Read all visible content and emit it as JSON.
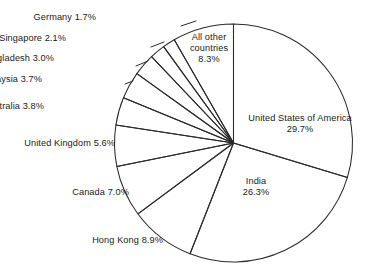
{
  "chart_data": {
    "type": "pie",
    "title": "",
    "subtitle": "",
    "xlabel": "",
    "ylabel": "",
    "legend_position": "none",
    "grid": false,
    "units": "percent",
    "start_angle_deg": 0,
    "direction": "clockwise",
    "categories": [
      "United States of America",
      "India",
      "Hong Kong",
      "Canada",
      "United Kingdom",
      "Australia",
      "Malaysia",
      "Bangladesh",
      "Singapore",
      "Germany",
      "All other countries"
    ],
    "values": [
      29.7,
      26.3,
      8.9,
      7.0,
      5.6,
      3.8,
      3.7,
      3.0,
      2.1,
      1.7,
      8.3
    ],
    "slices": [
      {
        "label": "United States of America",
        "value": 29.7,
        "value_text": "29.7%",
        "placement": "inside"
      },
      {
        "label": "India",
        "value": 26.3,
        "value_text": "26.3%",
        "placement": "inside"
      },
      {
        "label": "Hong Kong",
        "value": 8.9,
        "value_text": "8.9%",
        "placement": "outside"
      },
      {
        "label": "Canada",
        "value": 7.0,
        "value_text": "7.0%",
        "placement": "outside"
      },
      {
        "label": "United Kingdom",
        "value": 5.6,
        "value_text": "5.6%",
        "placement": "outside"
      },
      {
        "label": "Australia",
        "value": 3.8,
        "value_text": "3.8%",
        "placement": "outside"
      },
      {
        "label": "Malaysia",
        "value": 3.7,
        "value_text": "3.7%",
        "placement": "outside"
      },
      {
        "label": "Bangladesh",
        "value": 3.0,
        "value_text": "3.0%",
        "placement": "outside"
      },
      {
        "label": "Singapore",
        "value": 2.1,
        "value_text": "2.1%",
        "placement": "outside"
      },
      {
        "label": "Germany",
        "value": 1.7,
        "value_text": "1.7%",
        "placement": "outside"
      },
      {
        "label": "All other countries",
        "value": 8.3,
        "value_text": "8.3%",
        "placement": "inside"
      }
    ],
    "colors": {
      "slice_fill": "#ffffff",
      "slice_stroke": "#2b2b2b",
      "background": "#ffffff",
      "text": "#1a1a1a"
    }
  },
  "labels": {
    "germany": "Germany 1.7%",
    "singapore": "Singapore 2.1%",
    "bangladesh": "Bangladesh 3.0%",
    "malaysia": "Malaysia 3.7%",
    "australia": "Australia 3.8%",
    "united_kingdom": "United Kingdom 5.6%",
    "canada": "Canada 7.0%",
    "hong_kong": "Hong Kong 8.9%",
    "all_other_line1": "All other",
    "all_other_line2": "countries",
    "all_other_line3": "8.3%",
    "usa_line1": "United States of America",
    "usa_line2": "29.7%",
    "india_line1": "India",
    "india_line2": "26.3%"
  }
}
